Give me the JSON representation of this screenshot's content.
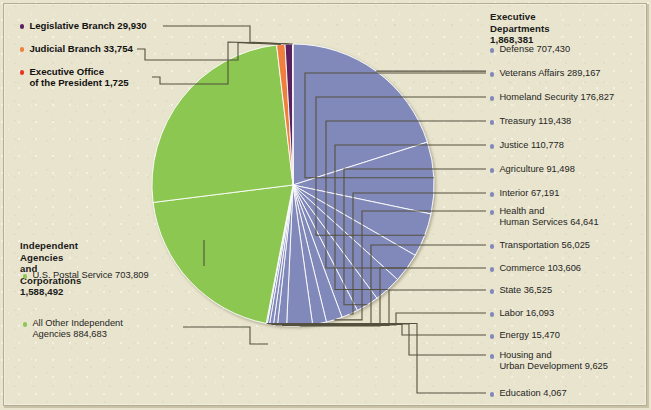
{
  "chart_data": {
    "type": "pie",
    "unit": "employees",
    "total": 3522312,
    "legend_position": "left-and-right",
    "grid": false,
    "groups": [
      {
        "name": "Executive Departments",
        "total": 1868381,
        "color": "#8189ba",
        "slices": [
          {
            "label": "Defense",
            "value": 707430
          },
          {
            "label": "Veterans Affairs",
            "value": 289167
          },
          {
            "label": "Homeland Security",
            "value": 176827
          },
          {
            "label": "Treasury",
            "value": 119438
          },
          {
            "label": "Justice",
            "value": 110778
          },
          {
            "label": "Agriculture",
            "value": 91498
          },
          {
            "label": "Interior",
            "value": 67191
          },
          {
            "label": "Health and Human Services",
            "value": 64641
          },
          {
            "label": "Transportation",
            "value": 56025
          },
          {
            "label": "Commerce",
            "value": 103606
          },
          {
            "label": "State",
            "value": 36525
          },
          {
            "label": "Labor",
            "value": 16093
          },
          {
            "label": "Energy",
            "value": 15470
          },
          {
            "label": "Housing and Urban Development",
            "value": 9625
          },
          {
            "label": "Education",
            "value": 4067
          }
        ]
      },
      {
        "name": "Independent Agencies and Corporations",
        "total": 1588492,
        "color": "#8cc751",
        "slices": [
          {
            "label": "U.S. Postal Service",
            "value": 703809
          },
          {
            "label": "All Other Independent Agencies",
            "value": 884683
          }
        ]
      },
      {
        "name": "Judicial Branch",
        "total": 33754,
        "color": "#ef7f3c",
        "slices": [
          {
            "label": "Judicial Branch",
            "value": 33754
          }
        ]
      },
      {
        "name": "Legislative Branch",
        "total": 29930,
        "color": "#5b2060",
        "slices": [
          {
            "label": "Legislative Branch",
            "value": 29930
          }
        ]
      },
      {
        "name": "Executive Office of the President",
        "total": 1725,
        "color": "#ea3323",
        "slices": [
          {
            "label": "Executive Office of the President",
            "value": 1725
          }
        ]
      }
    ]
  },
  "colors": {
    "background": "#e9e4cd",
    "executive_departments": "#8189ba",
    "independent_agencies": "#8cc751",
    "judicial_branch": "#ef7f3c",
    "legislative_branch": "#5b2060",
    "executive_office": "#ea3323",
    "leader_line": "#55503f",
    "text": "#242424"
  },
  "left_legend": {
    "items": [
      {
        "label": "Legislative Branch  29,930",
        "color": "#5b2060"
      },
      {
        "label": "Judicial Branch  33,754",
        "color": "#ef7f3c"
      },
      {
        "label": "Executive Office",
        "label2": "of the President  1,725",
        "color": "#ea3323"
      }
    ]
  },
  "independent_legend": {
    "heading_line1": "Independent Agencies",
    "heading_line2": "and Corporations 1,588,492",
    "items": [
      {
        "label": "U.S. Postal Service  703,809",
        "color": "#8cc751"
      },
      {
        "label": "All Other Independent",
        "label2": "Agencies  884,683",
        "color": "#8cc751"
      }
    ]
  },
  "executive_legend": {
    "heading_line1": "Executive Departments",
    "heading_line2": "1,868,381",
    "bullet_color": "#8189ba",
    "items": [
      {
        "label": "Defense  707,430"
      },
      {
        "label": "Veterans Affairs  289,167"
      },
      {
        "label": "Homeland Security  176,827"
      },
      {
        "label": "Treasury  119,438"
      },
      {
        "label": "Justice  110,778"
      },
      {
        "label": "Agriculture  91,498"
      },
      {
        "label": "Interior  67,191"
      },
      {
        "label": "Health and",
        "label2": "Human Services  64,641"
      },
      {
        "label": "Transportation  56,025"
      },
      {
        "label": "Commerce  103,606"
      },
      {
        "label": "State  36,525"
      },
      {
        "label": "Labor  16,093"
      },
      {
        "label": "Energy  15,470"
      },
      {
        "label": "Housing and",
        "label2": "Urban Development  9,625"
      },
      {
        "label": "Education  4,067"
      }
    ]
  }
}
